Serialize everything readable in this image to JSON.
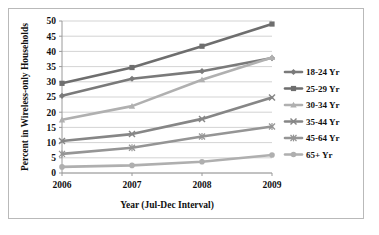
{
  "chart_data": {
    "type": "line",
    "title": "",
    "xlabel": "Year (Jul-Dec Interval)",
    "ylabel": "Percent in Wireless-only Households",
    "categories": [
      "2006",
      "2007",
      "2008",
      "2009"
    ],
    "x": [
      2006,
      2007,
      2008,
      2009
    ],
    "ylim": [
      0,
      50
    ],
    "ytick_labels": [
      "0",
      "5",
      "10",
      "15",
      "20",
      "25",
      "30",
      "35",
      "40",
      "45",
      "50"
    ],
    "yticks": [
      0,
      5,
      10,
      15,
      20,
      25,
      30,
      35,
      40,
      45,
      50
    ],
    "grid": true,
    "legend_position": "right",
    "series": [
      {
        "name": "18-24 Yr",
        "values": [
          25.4,
          31.0,
          33.5,
          37.8
        ],
        "color": "#7a7a7a",
        "marker": "diamond"
      },
      {
        "name": "25-29 Yr",
        "values": [
          29.5,
          34.7,
          41.7,
          49.0
        ],
        "color": "#6e6e6e",
        "marker": "square"
      },
      {
        "name": "30-34 Yr",
        "values": [
          17.5,
          22.0,
          30.7,
          38.0
        ],
        "color": "#b0b0b0",
        "marker": "triangle"
      },
      {
        "name": "35-44 Yr",
        "values": [
          10.5,
          12.8,
          17.8,
          24.8
        ],
        "color": "#868686",
        "marker": "cross"
      },
      {
        "name": "45-64 Yr",
        "values": [
          6.3,
          8.3,
          12.0,
          15.3
        ],
        "color": "#959595",
        "marker": "asterisk"
      },
      {
        "name": "65+ Yr",
        "values": [
          2.0,
          2.5,
          3.7,
          5.9
        ],
        "color": "#afafaf",
        "marker": "circle"
      }
    ]
  },
  "legend": {
    "items": [
      {
        "label": "18-24 Yr"
      },
      {
        "label": "25-29 Yr"
      },
      {
        "label": "30-34 Yr"
      },
      {
        "label": "35-44 Yr"
      },
      {
        "label": "45-64 Yr"
      },
      {
        "label": "65+ Yr"
      }
    ]
  },
  "axes": {
    "x_title": "Year (Jul-Dec Interval)",
    "y_title": "Percent in Wireless-only Households",
    "x_tick_labels": [
      "2006",
      "2007",
      "2008",
      "2009"
    ],
    "y_tick_labels": [
      "50",
      "45",
      "40",
      "35",
      "30",
      "25",
      "20",
      "15",
      "10",
      "5",
      "0"
    ]
  },
  "colors": {
    "frame": "#b9b9b9",
    "gridline": "#c8c8c8",
    "axis": "#9a9a9a",
    "text": "#111111",
    "background": "#ffffff"
  }
}
